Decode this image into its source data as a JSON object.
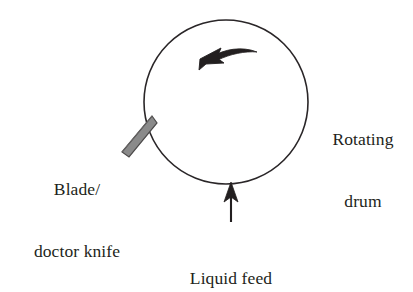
{
  "figure": {
    "type": "process-schematic",
    "background_color": "#ffffff",
    "line_color": "#231f20",
    "blade_fill_color": "#8a8a8a",
    "blade_stroke_color": "#4a4a4a"
  },
  "labels": {
    "rotating_drum": {
      "line1": "Rotating",
      "line2": "drum"
    },
    "blade": {
      "line1": "Blade/",
      "line2": "doctor knife"
    },
    "liquid_feed": {
      "line1": "Liquid feed"
    }
  },
  "elements": {
    "drum": {
      "name": "drum-circle",
      "center_x": 226,
      "center_y": 102,
      "radius": 82
    },
    "rotation_arrow": {
      "name": "rotation-direction-arrow",
      "direction": "counterclockwise",
      "description": "curved arrow inside drum pointing left"
    },
    "blade": {
      "name": "doctor-blade",
      "description": "gray angled bar contacting drum at lower left"
    },
    "feed_arrow": {
      "name": "liquid-feed-arrow",
      "direction": "up",
      "description": "straight arrow pointing up at bottom of drum"
    }
  }
}
